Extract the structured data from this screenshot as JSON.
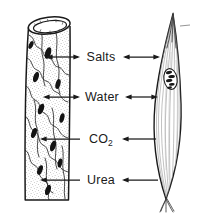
{
  "figure": {
    "background_color": "#ffffff",
    "ink_color": "#1a1a1a",
    "width": 201,
    "height": 213
  },
  "structures": {
    "left": {
      "name": "capillary",
      "description": "cut open-ended capillary tube with stippled endothelial wall and dark flattened nuclei"
    },
    "right": {
      "name": "muscle-fiber",
      "description": "spindle-shaped striated muscle fiber with central nucleus and splayed tapered ends"
    }
  },
  "exchanges": [
    {
      "label": "Salts",
      "label_html": "Salts",
      "y": 57,
      "left_arrow": "double",
      "right_arrow": "double"
    },
    {
      "label": "Water",
      "label_html": "Water",
      "y": 97,
      "left_arrow": "double",
      "right_arrow": "double"
    },
    {
      "label": "CO2",
      "label_html": "CO<sub>2</sub>",
      "y": 139,
      "left_arrow": "left",
      "right_arrow": "left"
    },
    {
      "label": "Urea",
      "label_html": "Urea",
      "y": 180,
      "left_arrow": "left",
      "right_arrow": "left"
    }
  ]
}
